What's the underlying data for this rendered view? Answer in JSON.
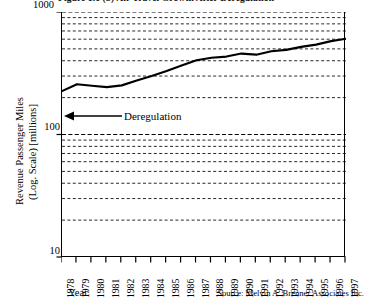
{
  "figure": {
    "title_clipped": "Figure 1.1 (b)  Air Travel Growth After Deregulation",
    "source": "Source: Melvin A. Brenner Associates Inc."
  },
  "axes": {
    "y_title_line1": "Revenue Passenger Miles",
    "y_title_line2": "(Log. Scale) [millions]",
    "y_ticks": [
      "1000",
      "100",
      "10"
    ],
    "x_title": "Year"
  },
  "annotation": {
    "label": "Deregulation",
    "arrow": "left-arrow-icon"
  },
  "chart_data": {
    "type": "line",
    "title": "Figure 1.1 (b)  Air Travel Growth After Deregulation",
    "xlabel": "Year",
    "ylabel": "Revenue Passenger Miles (Log. Scale) [millions]",
    "yscale": "log",
    "ylim": [
      10,
      1000
    ],
    "ytick_values": [
      1000,
      100,
      10
    ],
    "grid": true,
    "grid_style": "dashed horizontal log minor+major",
    "legend": "none",
    "annotations": [
      {
        "text": "Deregulation",
        "arrow": "left",
        "year": 1978,
        "value": 150
      }
    ],
    "source": "Source: Melvin A. Brenner Associates Inc.",
    "x": [
      1978,
      1979,
      1980,
      1981,
      1982,
      1983,
      1984,
      1985,
      1986,
      1987,
      1988,
      1989,
      1990,
      1991,
      1992,
      1993,
      1994,
      1995,
      1996,
      1997
    ],
    "series": [
      {
        "name": "Revenue Passenger Miles",
        "values": [
          226,
          257,
          250,
          244,
          252,
          276,
          300,
          330,
          366,
          404,
          423,
          433,
          458,
          448,
          478,
          490,
          519,
          541,
          578,
          605
        ]
      }
    ]
  }
}
